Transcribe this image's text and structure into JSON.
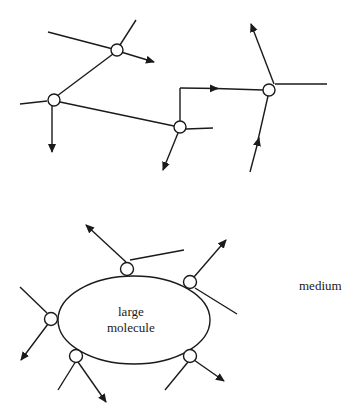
{
  "diagram": {
    "colors": {
      "stroke": "#1a1a1a",
      "background": "#ffffff"
    },
    "labels": {
      "large_molecule_line1": "large",
      "large_molecule_line2": "molecule",
      "medium": "medium"
    },
    "top_section": {
      "collision_points": [
        {
          "id": "A",
          "x": 117,
          "y": 50
        },
        {
          "id": "B",
          "x": 53,
          "y": 100
        },
        {
          "id": "C",
          "x": 180,
          "y": 127
        },
        {
          "id": "D",
          "x": 269,
          "y": 90
        }
      ]
    },
    "bottom_section": {
      "large_molecule": {
        "cx": 134,
        "cy": 320,
        "rx": 76,
        "ry": 44
      },
      "collision_points": [
        {
          "id": "top",
          "x": 127,
          "y": 269
        },
        {
          "id": "upper-right",
          "x": 190,
          "y": 282
        },
        {
          "id": "left",
          "x": 51,
          "y": 319
        },
        {
          "id": "lower-left",
          "x": 76,
          "y": 358
        },
        {
          "id": "lower-right",
          "x": 190,
          "y": 358
        }
      ]
    }
  }
}
